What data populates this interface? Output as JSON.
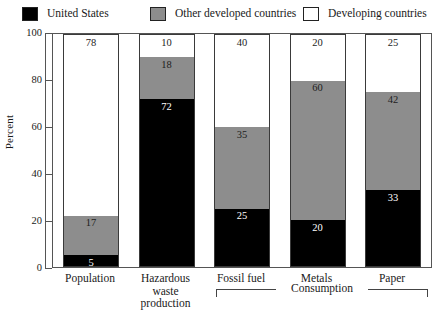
{
  "chart_data": {
    "type": "bar",
    "subtype": "stacked-bar-100",
    "title": "",
    "xlabel": "",
    "ylabel": "Percent",
    "ylim": [
      0,
      100
    ],
    "yticks": [
      0,
      20,
      40,
      60,
      80,
      100
    ],
    "grid": false,
    "legend_position": "top",
    "categories": [
      "Population",
      "Hazardous waste production",
      "Fossil fuel",
      "Metals",
      "Paper"
    ],
    "category_labels_display": [
      [
        "Population"
      ],
      [
        "Hazardous",
        "waste",
        "production"
      ],
      [
        "Fossil fuel"
      ],
      [
        "Metals"
      ],
      [
        "Paper"
      ]
    ],
    "series": [
      {
        "name": "United States",
        "color": "#000000",
        "values": [
          5,
          72,
          25,
          20,
          33
        ]
      },
      {
        "name": "Other developed countries",
        "color": "#8d8d8d",
        "values": [
          17,
          18,
          35,
          60,
          42
        ]
      },
      {
        "name": "Developing countries",
        "color": "#ffffff",
        "values": [
          78,
          10,
          40,
          20,
          25
        ]
      }
    ],
    "annotations": [
      {
        "text": "Consumption",
        "spans_categories": [
          "Fossil fuel",
          "Metals",
          "Paper"
        ],
        "style": "bracket-below-axis"
      }
    ]
  },
  "legend": {
    "items": [
      {
        "label": "United States",
        "color": "#000000"
      },
      {
        "label": "Other developed countries",
        "color": "#8d8d8d"
      },
      {
        "label": "Developing countries",
        "color": "#ffffff"
      }
    ]
  },
  "axis": {
    "y_title": "Percent",
    "y_tick_labels": [
      "100",
      "80",
      "60",
      "40",
      "20",
      "0"
    ]
  },
  "bars": [
    {
      "category": "Population",
      "lines": [
        "Population"
      ],
      "segments": [
        {
          "series": "Developing countries",
          "value": 78,
          "label": "78"
        },
        {
          "series": "Other developed countries",
          "value": 17,
          "label": "17"
        },
        {
          "series": "United States",
          "value": 5,
          "label": "5"
        }
      ]
    },
    {
      "category": "Hazardous waste production",
      "lines": [
        "Hazardous",
        "waste",
        "production"
      ],
      "segments": [
        {
          "series": "Developing countries",
          "value": 10,
          "label": "10"
        },
        {
          "series": "Other developed countries",
          "value": 18,
          "label": "18"
        },
        {
          "series": "United States",
          "value": 72,
          "label": "72"
        }
      ]
    },
    {
      "category": "Fossil fuel",
      "lines": [
        "Fossil fuel"
      ],
      "segments": [
        {
          "series": "Developing countries",
          "value": 40,
          "label": "40"
        },
        {
          "series": "Other developed countries",
          "value": 35,
          "label": "35"
        },
        {
          "series": "United States",
          "value": 25,
          "label": "25"
        }
      ]
    },
    {
      "category": "Metals",
      "lines": [
        "Metals"
      ],
      "segments": [
        {
          "series": "Developing countries",
          "value": 20,
          "label": "20"
        },
        {
          "series": "Other developed countries",
          "value": 60,
          "label": "60"
        },
        {
          "series": "United States",
          "value": 20,
          "label": "20"
        }
      ]
    },
    {
      "category": "Paper",
      "lines": [
        "Paper"
      ],
      "segments": [
        {
          "series": "Developing countries",
          "value": 25,
          "label": "25"
        },
        {
          "series": "Other developed countries",
          "value": 42,
          "label": "42"
        },
        {
          "series": "United States",
          "value": 33,
          "label": "33"
        }
      ]
    }
  ],
  "bracket": {
    "label": "Consumption"
  }
}
